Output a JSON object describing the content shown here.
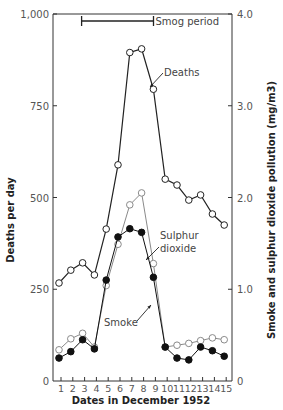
{
  "chart_data": {
    "type": "line",
    "title": "",
    "xlabel": "Dates in December 1952",
    "ylabel": "Deaths per day",
    "y2label": "Smoke and sulphur dioxide pollution (mg/m3)",
    "x": [
      1,
      2,
      3,
      4,
      5,
      6,
      7,
      8,
      9,
      10,
      11,
      12,
      13,
      14,
      15
    ],
    "x_tick_labels": [
      "1",
      "2",
      "3",
      "4",
      "5",
      "6",
      "7",
      "8",
      "9",
      "10",
      "11",
      "12",
      "13",
      "14",
      "15"
    ],
    "ylim": [
      0,
      1000
    ],
    "y_ticks": [
      0,
      250,
      500,
      750,
      1000
    ],
    "y_tick_labels": [
      "0",
      "250",
      "500",
      "750",
      "1,000"
    ],
    "y2lim": [
      0,
      4.0
    ],
    "y2_ticks": [
      0,
      1.0,
      2.0,
      3.0,
      4.0
    ],
    "y2_tick_labels": [
      "0",
      "1.0",
      "2.0",
      "3.0",
      "4.0"
    ],
    "grid": false,
    "series": [
      {
        "name": "Deaths",
        "axis": "left",
        "marker": "open-circle",
        "color": "#222222",
        "values": [
          267,
          302,
          322,
          289,
          414,
          589,
          895,
          905,
          795,
          550,
          534,
          493,
          507,
          455,
          425
        ]
      },
      {
        "name": "Sulphur dioxide",
        "axis": "right",
        "marker": "open-circle",
        "color": "#8a8a8a",
        "values": [
          0.34,
          0.46,
          0.52,
          0.37,
          1.04,
          1.49,
          1.92,
          2.05,
          1.28,
          0.37,
          0.39,
          0.41,
          0.44,
          0.47,
          0.45
        ]
      },
      {
        "name": "Smoke",
        "axis": "right",
        "marker": "filled-circle",
        "color": "#111111",
        "values": [
          0.25,
          0.32,
          0.45,
          0.35,
          1.1,
          1.57,
          1.66,
          1.62,
          1.13,
          0.37,
          0.25,
          0.23,
          0.37,
          0.33,
          0.27
        ]
      }
    ],
    "annotations": [
      {
        "text": "Smog period",
        "type": "range-bar",
        "from": 3,
        "to": 8.5
      },
      {
        "text": "Deaths",
        "type": "arrow-label"
      },
      {
        "text": "Sulphur",
        "text2": "dioxide",
        "type": "arrow-label"
      },
      {
        "text": "Smoke",
        "type": "arrow-label"
      }
    ],
    "legend": "inline annotations"
  }
}
